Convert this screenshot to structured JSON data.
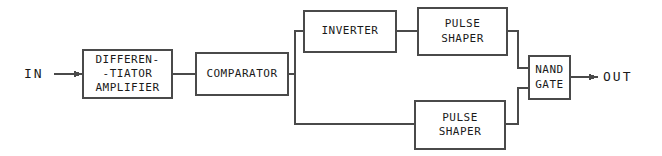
{
  "diagram": {
    "stroke_color": "#4a4a4a",
    "text_color": "#1a1a1a",
    "background_color": "#ffffff",
    "terminals": [
      {
        "name": "input",
        "label": "IN"
      },
      {
        "name": "output",
        "label": "OUT"
      }
    ],
    "blocks": [
      {
        "name": "differentiator-amplifier",
        "lines": [
          "DIFFEREN-",
          "-TIATOR",
          "AMPLIFIER"
        ],
        "x": 83,
        "y": 50,
        "w": 89,
        "h": 48,
        "font_size": 11
      },
      {
        "name": "comparator",
        "lines": [
          "COMPARATOR"
        ],
        "x": 196,
        "y": 53,
        "w": 92,
        "h": 42,
        "font_size": 11
      },
      {
        "name": "inverter",
        "lines": [
          "INVERTER"
        ],
        "x": 304,
        "y": 11,
        "w": 92,
        "h": 41,
        "font_size": 11
      },
      {
        "name": "pulse-shaper-upper",
        "lines": [
          "PULSE",
          "SHAPER"
        ],
        "x": 418,
        "y": 8,
        "w": 89,
        "h": 47,
        "font_size": 11
      },
      {
        "name": "pulse-shaper-lower",
        "lines": [
          "PULSE",
          "SHAPER"
        ],
        "x": 415,
        "y": 101,
        "w": 90,
        "h": 48,
        "font_size": 11
      },
      {
        "name": "nand-gate",
        "lines": [
          "NAND",
          "GATE"
        ],
        "x": 529,
        "y": 56,
        "w": 41,
        "h": 43,
        "font_size": 11
      }
    ],
    "connections": [
      {
        "name": "in-to-differentiator",
        "arrow": true
      },
      {
        "name": "differentiator-to-comparator",
        "arrow": false
      },
      {
        "name": "comparator-to-branch",
        "arrow": false
      },
      {
        "name": "branch-to-inverter",
        "arrow": false
      },
      {
        "name": "branch-to-pulse-shaper-lower",
        "arrow": false
      },
      {
        "name": "inverter-to-pulse-shaper-upper",
        "arrow": false
      },
      {
        "name": "pulse-shaper-upper-to-nand",
        "arrow": false
      },
      {
        "name": "pulse-shaper-lower-to-nand",
        "arrow": false
      },
      {
        "name": "nand-to-out",
        "arrow": true
      }
    ]
  }
}
